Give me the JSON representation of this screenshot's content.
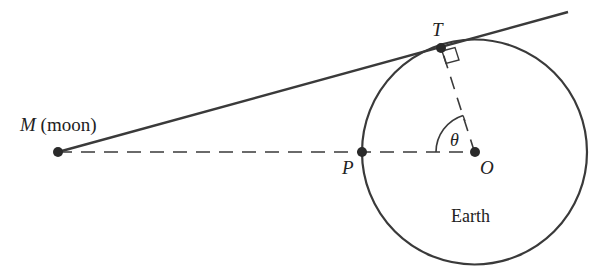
{
  "diagram": {
    "colors": {
      "stroke": "#3a3a3a",
      "point": "#2a2a2a",
      "text": "#222222",
      "background": "#ffffff"
    },
    "points": {
      "M": {
        "label": "M",
        "suffix": " (moon)"
      },
      "T": {
        "label": "T"
      },
      "P": {
        "label": "P"
      },
      "O": {
        "label": "O"
      }
    },
    "angle_label": "θ",
    "circle_label": "Earth",
    "elements": [
      "tangent line from M through T",
      "dashed segment M to O through P",
      "dashed radius O to T",
      "right-angle marker at T",
      "angle θ arc at O"
    ]
  }
}
